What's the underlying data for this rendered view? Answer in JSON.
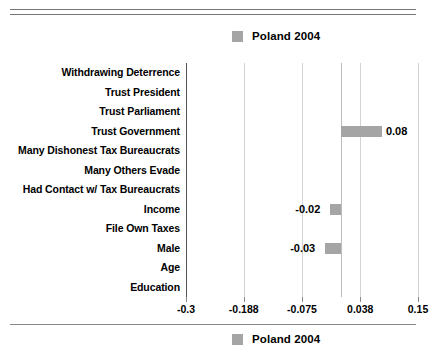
{
  "legend": {
    "top_label": "Poland 2004",
    "bottom_label": "Poland 2004",
    "swatch_color": "#a5a5a5"
  },
  "chart_data": {
    "type": "bar",
    "orientation": "horizontal",
    "title": "",
    "xlabel": "",
    "ylabel": "",
    "series": [
      {
        "name": "Poland 2004",
        "color": "#a5a5a5",
        "values": [
          null,
          null,
          null,
          0.08,
          null,
          null,
          null,
          -0.02,
          null,
          -0.03,
          null,
          null
        ]
      }
    ],
    "categories": [
      "Withdrawing Deterrence",
      "Trust President",
      "Trust Parliament",
      "Trust Government",
      "Many Dishonest Tax Bureaucrats",
      "Many Others Evade",
      "Had Contact w/ Tax Bureaucrats",
      "Income",
      "File Own Taxes",
      "Male",
      "Age",
      "Education"
    ],
    "value_labels": [
      "",
      "",
      "",
      "0.08",
      "",
      "",
      "",
      "-0.02",
      "",
      "-0.03",
      "",
      ""
    ],
    "xlim": [
      -0.3,
      0.15
    ],
    "xticks": [
      -0.3,
      -0.188,
      -0.075,
      0.038,
      0.15
    ],
    "xticklabels": [
      "-0.3",
      "-0.188",
      "-0.075",
      "0.038",
      "0.15"
    ],
    "grid": true,
    "legend_position": "top-center"
  },
  "rows": [
    {
      "label": "Withdrawing Deterrence",
      "value_label": ""
    },
    {
      "label": "Trust President",
      "value_label": ""
    },
    {
      "label": "Trust Parliament",
      "value_label": ""
    },
    {
      "label": "Trust Government",
      "value_label": "0.08"
    },
    {
      "label": "Many Dishonest Tax Bureaucrats",
      "value_label": ""
    },
    {
      "label": "Many Others Evade",
      "value_label": ""
    },
    {
      "label": "Had Contact w/ Tax Bureaucrats",
      "value_label": ""
    },
    {
      "label": "Income",
      "value_label": "-0.02"
    },
    {
      "label": "File Own Taxes",
      "value_label": ""
    },
    {
      "label": "Male",
      "value_label": "-0.03"
    },
    {
      "label": "Age",
      "value_label": ""
    },
    {
      "label": "Education",
      "value_label": ""
    }
  ],
  "xaxis": {
    "labels": [
      "-0.3",
      "-0.188",
      "-0.075",
      "0.038",
      "0.15"
    ]
  }
}
